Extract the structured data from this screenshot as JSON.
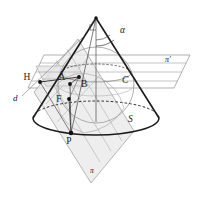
{
  "figure": {
    "background_color": "#ffffff",
    "stroke_color": "#1a1a1a",
    "thin_stroke_color": "#8a8a8a",
    "plane_fill_color": "#e9e9e9",
    "plane_fill_color_light": "#f2f2f2"
  },
  "labels": {
    "angle_alpha": "α",
    "point_h": "H",
    "point_a": "A",
    "point_b": "B",
    "point_c": "C",
    "point_f": "F",
    "point_p": "P",
    "sphere_s": "S",
    "plane_pi": "π",
    "plane_pi_prime": "π′",
    "line_d": "d"
  },
  "label_positions": {
    "angle_alpha": {
      "x": 120,
      "y": 33
    },
    "point_h": {
      "x": 27,
      "y": 80
    },
    "point_a": {
      "x": 62,
      "y": 80
    },
    "point_b": {
      "x": 81,
      "y": 85
    },
    "point_c": {
      "x": 122,
      "y": 82
    },
    "point_f": {
      "x": 59,
      "y": 101
    },
    "point_p": {
      "x": 68,
      "y": 141
    },
    "sphere_s": {
      "x": 128,
      "y": 121
    },
    "plane_pi": {
      "x": 90,
      "y": 172
    },
    "plane_pi_prime": {
      "x": 167,
      "y": 61
    },
    "line_d": {
      "x": 15,
      "y": 100
    }
  },
  "points": [
    {
      "name": "H",
      "x": 40,
      "y": 82
    },
    {
      "name": "A",
      "x": 70,
      "y": 84
    },
    {
      "name": "B",
      "x": 79,
      "y": 77
    },
    {
      "name": "F",
      "x": 69,
      "y": 99
    },
    {
      "name": "P",
      "x": 71,
      "y": 133
    },
    {
      "name": "apex",
      "x": 96,
      "y": 18
    }
  ],
  "geometry": {
    "apex": {
      "x": 96,
      "y": 18
    },
    "cone_base_center": {
      "x": 96,
      "y": 118
    },
    "cone_base_rx": 63,
    "cone_base_ry": 17,
    "sphere_center": {
      "x": 96,
      "y": 85
    },
    "sphere_r": 38,
    "contact_circle_center": {
      "x": 96,
      "y": 73
    },
    "contact_circle_rx": 35,
    "contact_circle_ry": 9
  }
}
